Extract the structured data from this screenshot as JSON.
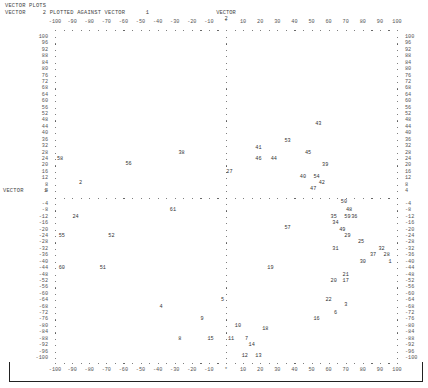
{
  "header": {
    "title": "VECTOR PLOTS",
    "subtitle": "VECTOR     2 PLOTTED AGAINST VECTOR      1",
    "y_vector_label": "VECTOR",
    "y_vector_num": "2",
    "x_vector_label": "VECTOR",
    "x_vector_num": "1"
  },
  "chart_data": {
    "type": "scatter",
    "title": "VECTOR PLOTS",
    "subtitle": "VECTOR 2 PLOTTED AGAINST VECTOR 1",
    "xlabel": "VECTOR 1",
    "ylabel": "VECTOR 2",
    "xlim": [
      -100,
      100
    ],
    "ylim": [
      -100,
      100
    ],
    "grid": false,
    "x_ticks": [
      -100,
      -90,
      -80,
      -70,
      -60,
      -50,
      -40,
      -30,
      -20,
      -10,
      0,
      10,
      20,
      30,
      40,
      50,
      60,
      70,
      80,
      90,
      100
    ],
    "x_tick_labels": [
      "-100",
      "-90",
      "-80",
      "-70",
      "-60",
      "-50",
      "-40",
      "-30",
      "-20",
      "-10",
      "*",
      "10",
      "20",
      "30",
      "40",
      "50",
      "60",
      "70",
      "80",
      "90",
      "100"
    ],
    "y_ticks": [
      100,
      96,
      92,
      88,
      84,
      80,
      76,
      72,
      68,
      64,
      60,
      56,
      52,
      48,
      44,
      40,
      36,
      32,
      28,
      24,
      20,
      16,
      12,
      8,
      4,
      0,
      -4,
      -8,
      -12,
      -16,
      -20,
      -24,
      -28,
      -32,
      -36,
      -40,
      -44,
      -48,
      -52,
      -56,
      -60,
      -64,
      -68,
      -72,
      -76,
      -80,
      -84,
      -88,
      -92,
      -96,
      -100
    ],
    "points": [
      {
        "label": "43",
        "x": 54,
        "y": 46
      },
      {
        "label": "53",
        "x": 36,
        "y": 35
      },
      {
        "label": "41",
        "x": 19,
        "y": 31
      },
      {
        "label": "38",
        "x": -26,
        "y": 28
      },
      {
        "label": "45",
        "x": 48,
        "y": 28
      },
      {
        "label": "58",
        "x": -97,
        "y": 24
      },
      {
        "label": "46",
        "x": 19,
        "y": 24
      },
      {
        "label": "44",
        "x": 28,
        "y": 24
      },
      {
        "label": "56",
        "x": -57,
        "y": 21
      },
      {
        "label": "39",
        "x": 58,
        "y": 20
      },
      {
        "label": "27",
        "x": 2,
        "y": 16
      },
      {
        "label": "40",
        "x": 45,
        "y": 13
      },
      {
        "label": "54",
        "x": 53,
        "y": 13
      },
      {
        "label": "2",
        "x": -85,
        "y": 9
      },
      {
        "label": "42",
        "x": 56,
        "y": 9
      },
      {
        "label": "47",
        "x": 51,
        "y": 5
      },
      {
        "label": "50",
        "x": 69,
        "y": -3
      },
      {
        "label": "61",
        "x": -31,
        "y": -8
      },
      {
        "label": "48",
        "x": 72,
        "y": -8
      },
      {
        "label": "24",
        "x": -88,
        "y": -12
      },
      {
        "label": "35",
        "x": 63,
        "y": -12
      },
      {
        "label": "59",
        "x": 71,
        "y": -12
      },
      {
        "label": "36",
        "x": 75,
        "y": -12
      },
      {
        "label": "34",
        "x": 64,
        "y": -16
      },
      {
        "label": "57",
        "x": 36,
        "y": -19
      },
      {
        "label": "49",
        "x": 68,
        "y": -20
      },
      {
        "label": "55",
        "x": -96,
        "y": -24
      },
      {
        "label": "52",
        "x": -67,
        "y": -24
      },
      {
        "label": "29",
        "x": 71,
        "y": -24
      },
      {
        "label": "25",
        "x": 79,
        "y": -28
      },
      {
        "label": "31",
        "x": 64,
        "y": -32
      },
      {
        "label": "32",
        "x": 91,
        "y": -32
      },
      {
        "label": "37",
        "x": 86,
        "y": -36
      },
      {
        "label": "28",
        "x": 94,
        "y": -36
      },
      {
        "label": "30",
        "x": 80,
        "y": -40
      },
      {
        "label": "1",
        "x": 96,
        "y": -40
      },
      {
        "label": "60",
        "x": -96,
        "y": -44
      },
      {
        "label": "51",
        "x": -72,
        "y": -44
      },
      {
        "label": "19",
        "x": 26,
        "y": -44
      },
      {
        "label": "21",
        "x": 70,
        "y": -48
      },
      {
        "label": "20",
        "x": 63,
        "y": -52
      },
      {
        "label": "17",
        "x": 70,
        "y": -52
      },
      {
        "label": "5",
        "x": -2,
        "y": -64
      },
      {
        "label": "22",
        "x": 60,
        "y": -64
      },
      {
        "label": "4",
        "x": -38,
        "y": -68
      },
      {
        "label": "3",
        "x": 70,
        "y": -67
      },
      {
        "label": "6",
        "x": 64,
        "y": -72
      },
      {
        "label": "9",
        "x": -14,
        "y": -76
      },
      {
        "label": "16",
        "x": 53,
        "y": -76
      },
      {
        "label": "10",
        "x": 7,
        "y": -80
      },
      {
        "label": "18",
        "x": 23,
        "y": -82
      },
      {
        "label": "8",
        "x": -27,
        "y": -88
      },
      {
        "label": "15",
        "x": -9,
        "y": -88
      },
      {
        "label": "11",
        "x": 3,
        "y": -88
      },
      {
        "label": "7",
        "x": 12,
        "y": -88
      },
      {
        "label": "14",
        "x": 15,
        "y": -92
      },
      {
        "label": "12",
        "x": 11,
        "y": -99
      },
      {
        "label": "13",
        "x": 19,
        "y": -99
      }
    ]
  }
}
